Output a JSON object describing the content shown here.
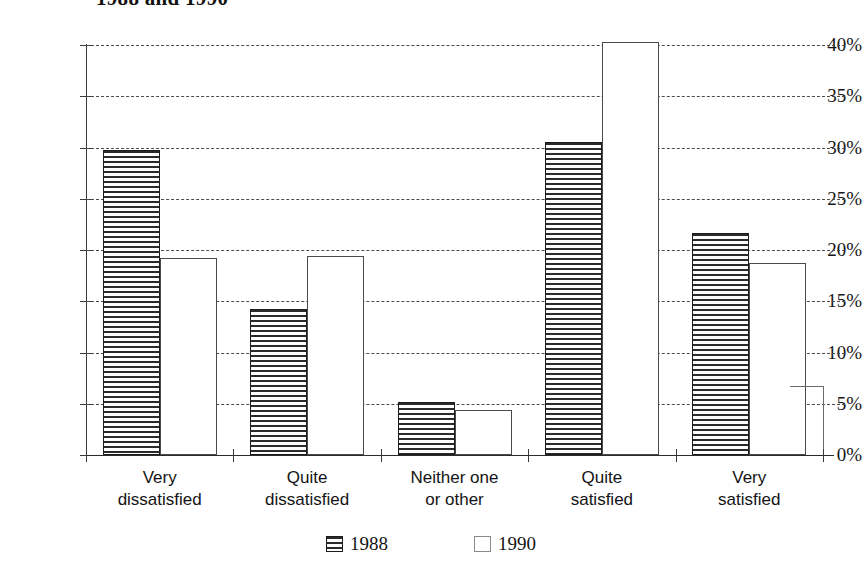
{
  "title": "1988 and 1990",
  "chart_data": {
    "type": "bar",
    "title": "1988 and 1990",
    "xlabel": "",
    "ylabel": "",
    "ylim": [
      0,
      40
    ],
    "yticks": [
      0,
      5,
      10,
      15,
      20,
      25,
      30,
      35,
      40
    ],
    "ytick_labels": [
      "0%",
      "5%",
      "10%",
      "15%",
      "20%",
      "25%",
      "30%",
      "35%",
      "40%"
    ],
    "grid": true,
    "legend_position": "bottom",
    "categories": [
      "Very dissatisfied",
      "Quite dissatisfied",
      "Neither one or other",
      "Quite satisfied",
      "Very satisfied"
    ],
    "category_lines": [
      [
        "Very",
        "dissatisfied"
      ],
      [
        "Quite",
        "dissatisfied"
      ],
      [
        "Neither one",
        "or other"
      ],
      [
        "Quite",
        "satisfied"
      ],
      [
        "Very",
        "satisfied"
      ]
    ],
    "series": [
      {
        "name": "1988",
        "pattern": "horizontal-stripes",
        "values": [
          29.8,
          14.2,
          5.2,
          30.5,
          21.7
        ]
      },
      {
        "name": "1990",
        "pattern": "empty",
        "values": [
          19.2,
          19.4,
          4.4,
          40.3,
          18.7
        ]
      }
    ]
  },
  "legend": {
    "items": [
      {
        "label": "1988",
        "swatch": "striped-swatch-icon"
      },
      {
        "label": "1990",
        "swatch": "empty-swatch-icon"
      }
    ]
  }
}
